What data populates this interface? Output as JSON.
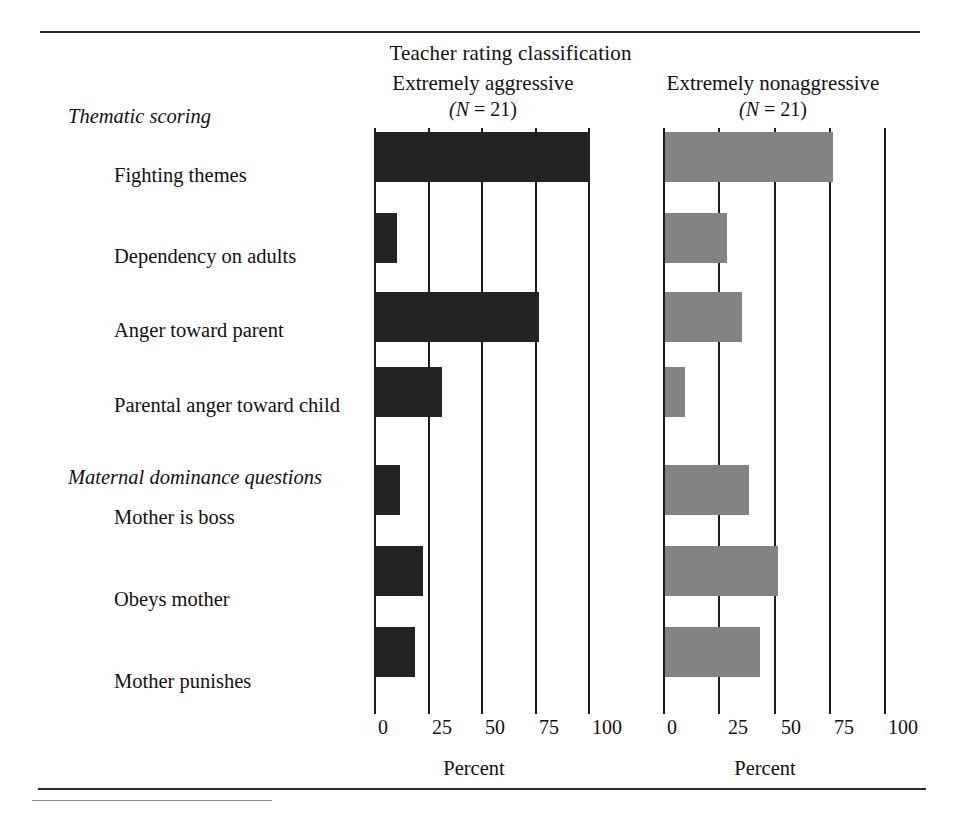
{
  "figure": {
    "super_header": "Teacher rating classification",
    "columns": [
      {
        "id": "aggressive",
        "label": "Extremely aggressive",
        "n_label": "(N = 21)",
        "color": "#232323"
      },
      {
        "id": "nonaggressive",
        "label": "Extremely nonaggressive",
        "n_label": "(N = 21)",
        "color": "#838383"
      }
    ],
    "axis_title": "Percent",
    "axis_title_right": "Percent",
    "groups": [
      {
        "id": "thematic",
        "label": "Thematic scoring"
      },
      {
        "id": "maternal",
        "label": "Maternal dominance questions"
      }
    ],
    "ticks": [
      "0",
      "25",
      "50",
      "75",
      "100"
    ]
  },
  "chart_data": {
    "type": "bar",
    "title": "Teacher rating classification",
    "xlabel": "Percent",
    "ylabel": "",
    "xlim": [
      0,
      100
    ],
    "grid": true,
    "orientation": "horizontal",
    "legend": "none",
    "panels": [
      {
        "name": "Extremely aggressive",
        "n": 21,
        "color": "#232323"
      },
      {
        "name": "Extremely nonaggressive",
        "n": 21,
        "color": "#838383"
      }
    ],
    "groups": [
      {
        "name": "Thematic scoring",
        "categories": [
          "Fighting themes",
          "Dependency on adults",
          "Anger toward parent",
          "Parental anger toward child"
        ],
        "series": [
          {
            "name": "Extremely aggressive",
            "values": [
              100,
              10,
              76,
              31
            ]
          },
          {
            "name": "Extremely nonaggressive",
            "values": [
              76,
              28,
              35,
              9
            ]
          }
        ]
      },
      {
        "name": "Maternal dominance questions",
        "categories": [
          "Mother is boss",
          "Obeys mother",
          "Mother punishes"
        ],
        "series": [
          {
            "name": "Extremely aggressive",
            "values": [
              11,
              22,
              18
            ]
          },
          {
            "name": "Extremely nonaggressive",
            "values": [
              38,
              51,
              43
            ]
          }
        ]
      }
    ],
    "categories": [
      "Fighting themes",
      "Dependency on adults",
      "Anger toward parent",
      "Parental anger toward child",
      "Mother is boss",
      "Obeys mother",
      "Mother punishes"
    ],
    "series": [
      {
        "name": "Extremely aggressive",
        "values": [
          100,
          10,
          76,
          31,
          11,
          22,
          18
        ]
      },
      {
        "name": "Extremely nonaggressive",
        "values": [
          76,
          28,
          35,
          9,
          38,
          51,
          43
        ]
      }
    ]
  }
}
